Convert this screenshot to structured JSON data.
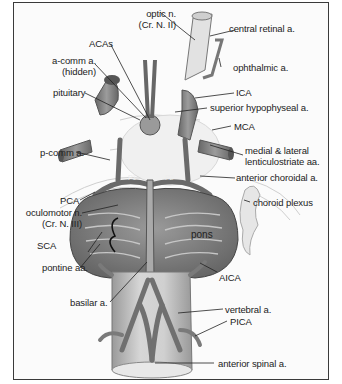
{
  "figure": {
    "colors": {
      "artery": "#8a8a8a",
      "artery_dark": "#5a5a5a",
      "pons": "#7c7c7c",
      "brainstem": "#c8c8c8",
      "frame": "#3a3a3a",
      "background": "#fbfbfb"
    }
  },
  "labels": {
    "optic_n": {
      "line1": "optic n.",
      "line2": "(Cr. N. II)"
    },
    "central_retinal_a": "central retinal a.",
    "acas": "ACAs",
    "a_comm_a": {
      "line1": "a-comm a.",
      "line2": "(hidden)"
    },
    "ophthalmic_a": "ophthalmic a.",
    "pituitary": "pituitary",
    "ica": "ICA",
    "superior_hypophyseal_a": "superior hypophyseal a.",
    "mca": "MCA",
    "p_comm_a": "p-comm a.",
    "medial_lateral_lenticulostriate": {
      "line1": "medial & lateral",
      "line2": "lenticulostriate aa."
    },
    "anterior_choroidal_a": "anterior choroidal a.",
    "pca": "PCA",
    "oculomotor_n": {
      "line1": "oculomotor n.",
      "line2": "(Cr. N. III)"
    },
    "choroid_plexus": "choroid plexus",
    "sca": "SCA",
    "pons": "pons",
    "pontine_aa": "pontine aa.",
    "aica": "AICA",
    "basilar_a": "basilar a.",
    "vertebral_a": "vertebral a.",
    "pica": "PICA",
    "anterior_spinal_a": "anterior spinal a.",
    "p1": "P1",
    "p2": "P2"
  }
}
